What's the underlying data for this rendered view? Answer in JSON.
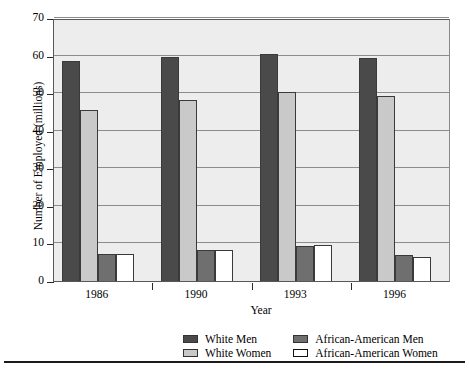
{
  "chart_data": {
    "type": "bar",
    "title": "",
    "xlabel": "Year",
    "ylabel": "Number of Employed (millions)",
    "categories": [
      "1986",
      "1990",
      "1993",
      "1996"
    ],
    "ylim": [
      0,
      70
    ],
    "yticks": [
      0,
      10,
      20,
      30,
      40,
      50,
      60,
      70
    ],
    "grid": true,
    "legend_position": "bottom",
    "series": [
      {
        "name": "White Men",
        "color": "#4a4a4a",
        "values": [
          58.5,
          59.5,
          60.5,
          59.3
        ]
      },
      {
        "name": "White Women",
        "color": "#c9c9c9",
        "values": [
          45.4,
          48.3,
          50.2,
          49.2
        ]
      },
      {
        "name": "African-American Men",
        "color": "#6f6f6f",
        "values": [
          7.2,
          8.2,
          9.3,
          6.9
        ]
      },
      {
        "name": "African-American Women",
        "color": "#ffffff",
        "values": [
          7.3,
          8.3,
          9.5,
          6.5
        ]
      }
    ]
  },
  "axis": {
    "y_title": "Number of Employed (millions)",
    "x_title": "Year",
    "y_tick_labels": [
      "70",
      "60",
      "50",
      "40",
      "30",
      "20",
      "10",
      "0"
    ],
    "x_tick_labels": [
      "1986",
      "1990",
      "1993",
      "1996"
    ]
  },
  "legend": {
    "entries": [
      {
        "label": "White Men",
        "swatch": "legend-swatch-white-men"
      },
      {
        "label": "African-American Men",
        "swatch": "legend-swatch-african-american-men"
      },
      {
        "label": "White Women",
        "swatch": "legend-swatch-white-women"
      },
      {
        "label": "African-American Women",
        "swatch": "legend-swatch-african-american-women"
      }
    ]
  }
}
